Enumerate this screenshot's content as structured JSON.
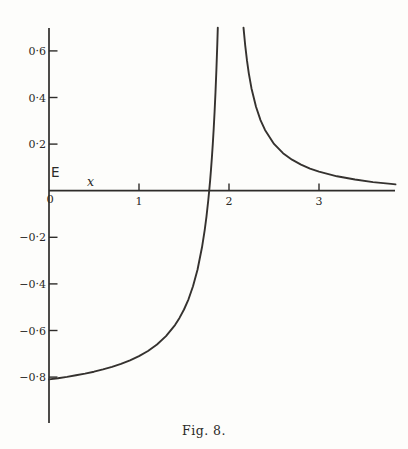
{
  "figure": {
    "caption": "Fig. 8.",
    "y_axis_label": "E",
    "x_axis_label": "x",
    "origin_label": "0"
  },
  "chart_data": {
    "type": "line",
    "title": "Fig. 8.",
    "xlabel": "x",
    "ylabel": "E",
    "xlim": [
      0,
      3.85
    ],
    "ylim": [
      -1.0,
      0.7
    ],
    "grid": false,
    "legend": "none",
    "asymptote_x": 2,
    "x_ticks": [
      {
        "value": 1,
        "label": "1"
      },
      {
        "value": 2,
        "label": "2"
      },
      {
        "value": 3,
        "label": "3"
      }
    ],
    "y_ticks": [
      {
        "value": 0.6,
        "label": "0·6"
      },
      {
        "value": 0.4,
        "label": "0·4"
      },
      {
        "value": 0.2,
        "label": "0·2"
      },
      {
        "value": -0.2,
        "label": "−0·2"
      },
      {
        "value": -0.4,
        "label": "−0·4"
      },
      {
        "value": -0.6,
        "label": "−0·6"
      },
      {
        "value": -0.8,
        "label": "−0·8"
      }
    ],
    "series": [
      {
        "name": "left-branch",
        "points": [
          [
            0.0,
            -0.81
          ],
          [
            0.1,
            -0.805
          ],
          [
            0.2,
            -0.799
          ],
          [
            0.3,
            -0.792
          ],
          [
            0.4,
            -0.785
          ],
          [
            0.5,
            -0.777
          ],
          [
            0.6,
            -0.767
          ],
          [
            0.7,
            -0.756
          ],
          [
            0.8,
            -0.743
          ],
          [
            0.9,
            -0.728
          ],
          [
            1.0,
            -0.71
          ],
          [
            1.1,
            -0.688
          ],
          [
            1.2,
            -0.66
          ],
          [
            1.3,
            -0.624
          ],
          [
            1.4,
            -0.577
          ],
          [
            1.45,
            -0.546
          ],
          [
            1.5,
            -0.51
          ],
          [
            1.55,
            -0.466
          ],
          [
            1.6,
            -0.41
          ],
          [
            1.65,
            -0.339
          ],
          [
            1.7,
            -0.243
          ],
          [
            1.73,
            -0.169
          ],
          [
            1.75,
            -0.11
          ],
          [
            1.77,
            -0.04
          ],
          [
            1.78,
            0.0
          ],
          [
            1.79,
            0.042
          ],
          [
            1.8,
            0.09
          ],
          [
            1.81,
            0.143
          ],
          [
            1.82,
            0.201
          ],
          [
            1.83,
            0.266
          ],
          [
            1.84,
            0.34
          ],
          [
            1.85,
            0.423
          ],
          [
            1.86,
            0.519
          ],
          [
            1.87,
            0.629
          ],
          [
            1.876,
            0.7
          ]
        ]
      },
      {
        "name": "right-branch",
        "points": [
          [
            2.161,
            0.7
          ],
          [
            2.18,
            0.624
          ],
          [
            2.2,
            0.558
          ],
          [
            2.22,
            0.504
          ],
          [
            2.25,
            0.439
          ],
          [
            2.3,
            0.36
          ],
          [
            2.35,
            0.303
          ],
          [
            2.4,
            0.261
          ],
          [
            2.5,
            0.201
          ],
          [
            2.6,
            0.161
          ],
          [
            2.7,
            0.133
          ],
          [
            2.8,
            0.112
          ],
          [
            2.9,
            0.095
          ],
          [
            3.0,
            0.082
          ],
          [
            3.2,
            0.062
          ],
          [
            3.4,
            0.048
          ],
          [
            3.6,
            0.037
          ],
          [
            3.8,
            0.029
          ],
          [
            3.85,
            0.027
          ]
        ]
      }
    ]
  }
}
